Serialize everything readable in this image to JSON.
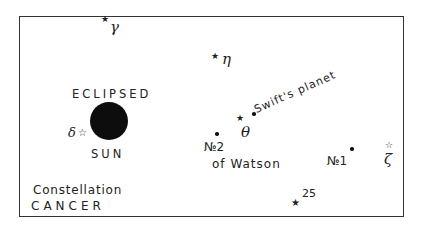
{
  "diagram": {
    "type": "star chart",
    "constellation_label": {
      "line1": "Constellation",
      "line2": "CANCER"
    },
    "sun": {
      "label_top": "ECLIPSED",
      "label_bottom": "SUN"
    },
    "stars": [
      {
        "symbol": "★",
        "name": "γ"
      },
      {
        "symbol": "★",
        "name": "η"
      },
      {
        "symbol": "☆",
        "name": "δ"
      },
      {
        "symbol": "★",
        "name": "θ"
      },
      {
        "symbol": "☆",
        "name": "ζ"
      },
      {
        "symbol": "★",
        "name": "25"
      }
    ],
    "planets": [
      {
        "name": "Swift's planet"
      },
      {
        "name_line1": "№2",
        "name_line2": "of Watson"
      },
      {
        "name": "№1"
      }
    ]
  }
}
